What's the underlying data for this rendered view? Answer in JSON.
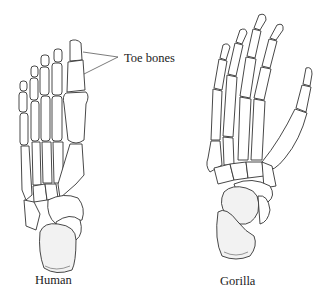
{
  "figure": {
    "type": "anatomical-comparison",
    "callout": {
      "label": "Toe bones"
    },
    "panels": [
      {
        "id": "human",
        "caption": "Human"
      },
      {
        "id": "gorilla",
        "caption": "Gorilla"
      }
    ]
  }
}
